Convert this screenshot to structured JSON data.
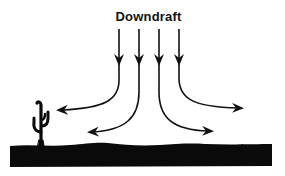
{
  "diagram": {
    "title": "Downdraft",
    "colors": {
      "ink": "#111111",
      "background": "#ffffff",
      "ground": "#0a0a0a"
    },
    "elements": {
      "downdraft_arrows": [
        {
          "id": 1,
          "direction": "down-then-left"
        },
        {
          "id": 2,
          "direction": "down-then-left"
        },
        {
          "id": 3,
          "direction": "down-then-right"
        },
        {
          "id": 4,
          "direction": "down-then-right"
        }
      ],
      "ground": "desert-ground",
      "cactus": "cactus-icon"
    }
  }
}
